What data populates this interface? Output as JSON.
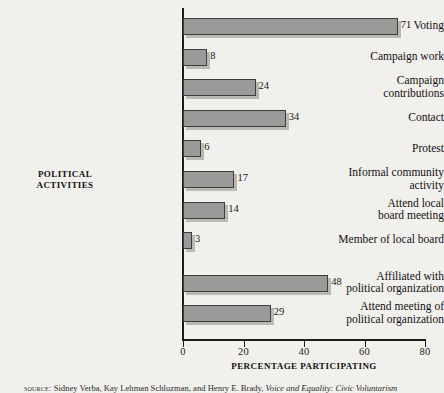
{
  "chart_data": {
    "type": "bar",
    "orientation": "horizontal",
    "title": "",
    "xlabel": "PERCENTAGE PARTICIPATING",
    "ylabel": "POLITICAL\nACTIVITIES",
    "xlim": [
      0,
      80
    ],
    "xticks": [
      0,
      20,
      40,
      60,
      80
    ],
    "xtick_labels": [
      "0",
      "20",
      "40",
      "60",
      "80"
    ],
    "grid": false,
    "legend": "none",
    "bar_color": "#9a9a98",
    "bar_edge_color": "#3d3d3d",
    "background_color": "#f2f0ec",
    "categories": [
      "Voting",
      "Campaign work",
      "Campaign\ncontributions",
      "Contact",
      "Protest",
      "Informal community\nactivity",
      "Attend local\nboard meeting",
      "Member of local board",
      "Affiliated with\npolitical organization",
      "Attend meeting of\npolitical organization"
    ],
    "values": [
      71,
      8,
      24,
      34,
      6,
      17,
      14,
      3,
      48,
      29
    ],
    "value_labels": [
      "71",
      "8",
      "24",
      "34",
      "6",
      "17",
      "14",
      "3",
      "48",
      "29"
    ]
  },
  "source": {
    "kicker": "source:",
    "authors": "Sidney Verba, Kay Lehman Schlozman, and Henry E. Brady,",
    "title": "Voice and Equality: Civic Voluntarism"
  }
}
